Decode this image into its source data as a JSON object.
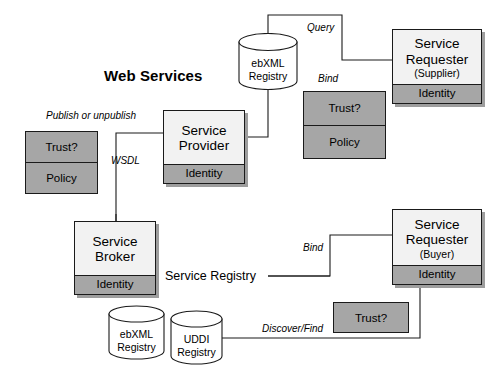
{
  "diagram": {
    "title": "Web Services",
    "background_color": "#ffffff",
    "line_color": "#1a1a1a",
    "box_fill": "#f2f2f2",
    "grey_fill": "#a6a6a6",
    "shadow_color": "#9d9d9d"
  },
  "actors": {
    "service_provider": {
      "name": "Service\nProvider",
      "footer": "Identity"
    },
    "service_broker": {
      "name": "Service\nBroker",
      "footer": "Identity"
    },
    "service_requester_supplier": {
      "name": "Service\nRequester",
      "sub": "(Supplier)",
      "footer": "Identity"
    },
    "service_requester_buyer": {
      "name": "Service\nRequester",
      "sub": "(Buyer)",
      "footer": "Identity"
    }
  },
  "policy_boxes": {
    "left": {
      "rows": [
        "Trust?",
        "Policy"
      ]
    },
    "upper_right": {
      "rows": [
        "Trust?",
        "Policy"
      ]
    },
    "lower_right": {
      "rows": [
        "Trust?"
      ]
    }
  },
  "registries": {
    "top_ebxml": {
      "label": "ebXML\nRegistry"
    },
    "bottom_ebxml": {
      "label": "ebXML\nRegistry"
    },
    "bottom_uddi": {
      "label": "UDDI\nRegistry"
    }
  },
  "edge_labels": {
    "publish": "Publish or unpublish",
    "wsdl": "WSDL",
    "query": "Query",
    "bind_top": "Bind",
    "bind_bottom": "Bind",
    "discover": "Discover/Find"
  },
  "annotations": {
    "service_registry": "Service Registry"
  }
}
